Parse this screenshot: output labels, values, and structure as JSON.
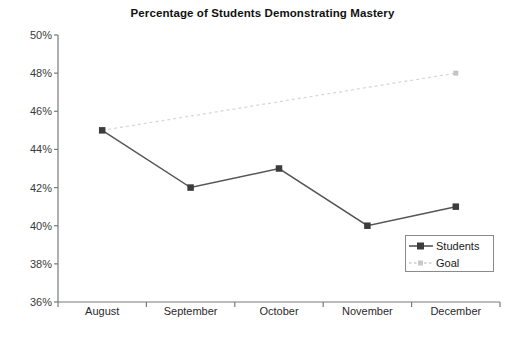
{
  "chart_data": {
    "type": "line",
    "title": "Percentage of Students Demonstrating Mastery",
    "xlabel": "",
    "ylabel": "",
    "categories": [
      "August",
      "September",
      "October",
      "November",
      "December"
    ],
    "series": [
      {
        "name": "Students",
        "values": [
          45,
          42,
          43,
          40,
          41
        ],
        "color": "#555555",
        "style": "solid",
        "marker": "square"
      },
      {
        "name": "Goal",
        "values": [
          45,
          45.75,
          46.5,
          47.25,
          48
        ],
        "color": "#d8d8d8",
        "style": "dotted",
        "marker": "square"
      }
    ],
    "ylim": [
      36,
      50
    ],
    "ytick_step": 2,
    "ytick_labels": [
      "50%",
      "48%",
      "46%",
      "44%",
      "42%",
      "40%",
      "38%",
      "36%"
    ],
    "ytick_values": [
      50,
      48,
      46,
      44,
      42,
      40,
      38,
      36
    ],
    "grid": false,
    "legend_position": "lower-right",
    "legend_entries": [
      "Students",
      "Goal"
    ],
    "axis_color": "#7a7a7a",
    "background": "#ffffff"
  }
}
